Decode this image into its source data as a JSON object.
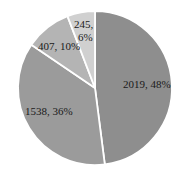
{
  "chart_data": {
    "type": "pie",
    "title": "",
    "start_angle_deg": 0,
    "direction": "clockwise",
    "categories": [
      "A",
      "B",
      "C",
      "D"
    ],
    "values": [
      2019,
      1538,
      407,
      245
    ],
    "percentages": [
      48,
      36,
      10,
      6
    ],
    "labels": [
      "2019, 48%",
      "1538, 36%",
      "407, 10%",
      "245,\n6%"
    ],
    "colors": [
      "#8e8e8e",
      "#9b9b9b",
      "#b4b4b4",
      "#d0d0d0"
    ],
    "legend": "none",
    "separator_color": "#ffffff"
  },
  "labels": {
    "slice0": "2019, 48%",
    "slice1": "1538, 36%",
    "slice2": "407, 10%",
    "slice3_line1": "245,",
    "slice3_line2": "6%"
  }
}
